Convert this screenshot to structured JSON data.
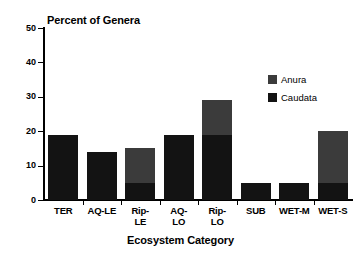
{
  "chart_data": {
    "type": "bar",
    "title": "Percent of Genera",
    "xlabel": "Ecosystem Category",
    "ylabel": "",
    "stacked": true,
    "grid": false,
    "ylim": [
      0,
      50
    ],
    "yticks": [
      0,
      10,
      20,
      30,
      40,
      50
    ],
    "ytick_labels": [
      "0",
      "10",
      "20",
      "30",
      "40",
      "50"
    ],
    "legend_position": "upper right",
    "categories": [
      "TER",
      "AQ-LE",
      "Rip-LE",
      "AQ-LO",
      "Rip-LO",
      "SUB",
      "WET-M",
      "WET-S"
    ],
    "category_label_lines": [
      [
        "TER"
      ],
      [
        "AQ-LE"
      ],
      [
        "Rip-",
        "LE"
      ],
      [
        "AQ-",
        "LO"
      ],
      [
        "Rip-",
        "LO"
      ],
      [
        "SUB"
      ],
      [
        "WET-M"
      ],
      [
        "WET-S"
      ]
    ],
    "series": [
      {
        "name": "Caudata",
        "color": "#131313",
        "values": [
          19,
          14,
          5,
          19,
          19,
          5,
          5,
          5
        ]
      },
      {
        "name": "Anura",
        "color": "#3b3b3b",
        "values": [
          0,
          0,
          10,
          0,
          10,
          0,
          0,
          15
        ]
      }
    ],
    "totals": [
      19,
      14,
      15,
      19,
      29,
      5,
      5,
      20
    ]
  },
  "legend": {
    "entries": [
      {
        "label": "Anura",
        "color": "#3b3b3b"
      },
      {
        "label": "Caudata",
        "color": "#131313"
      }
    ]
  },
  "colors": {
    "background": "#ffffff",
    "axis": "#000000",
    "text": "#000000",
    "anura": "#3b3b3b",
    "caudata": "#131313"
  }
}
